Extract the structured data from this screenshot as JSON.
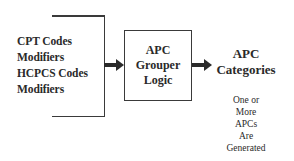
{
  "diagram": {
    "inputs": {
      "lines": [
        "CPT Codes",
        "Modifiers",
        "HCPCS Codes",
        "Modifiers"
      ]
    },
    "process": {
      "lines": [
        "APC",
        "Grouper",
        "Logic"
      ]
    },
    "output": {
      "title_lines": [
        "APC",
        "Categories"
      ],
      "note_lines": [
        "One or",
        "More",
        "APCs",
        "Are",
        "Generated"
      ]
    },
    "colors": {
      "line": "#3a3a3a",
      "text": "#2a2a2a",
      "background": "#ffffff"
    },
    "flow": [
      "inputs",
      "process",
      "output"
    ]
  }
}
